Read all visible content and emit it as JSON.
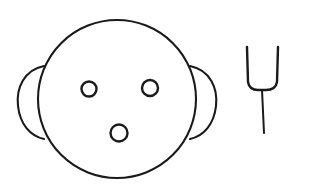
{
  "figure": {
    "background_color": "#ffffff",
    "stroke_color": "#1a1a1a",
    "canvas": {
      "width": 309,
      "height": 184
    }
  },
  "face": {
    "label": "face",
    "head": {
      "label": "head-outline",
      "shape": "ellipse",
      "cx": 117,
      "cy": 99,
      "rx": 79,
      "ry": 79
    },
    "ears": [
      {
        "label": "left-ear",
        "side": "left",
        "path": "M 44 66 C 24 70 16 88 18 106 C 20 124 30 136 44 139"
      },
      {
        "label": "right-ear",
        "side": "right",
        "path": "M 190 66 C 210 70 218 88 216 106 C 214 124 204 136 190 139"
      }
    ],
    "eyes": [
      {
        "label": "left-eye",
        "cx": 89,
        "cy": 89,
        "r": 7.5
      },
      {
        "label": "right-eye",
        "cx": 150,
        "cy": 88,
        "r": 8.0
      }
    ],
    "mouth": {
      "label": "mouth",
      "cx": 119,
      "cy": 133,
      "r": 8.5
    }
  },
  "tuning_fork": {
    "label": "tuning-fork",
    "prongs_path": "M 247 47 L 248 82 C 249 88 253 90 258 90 L 262 90 L 266 90 C 272 90 276 88 277 82 L 278 47",
    "stem_path": "M 262 90 L 264 133",
    "left_prong_top": {
      "x": 247,
      "y": 47
    },
    "right_prong_top": {
      "x": 278,
      "y": 47
    },
    "stem_bottom": {
      "x": 264,
      "y": 133
    }
  }
}
